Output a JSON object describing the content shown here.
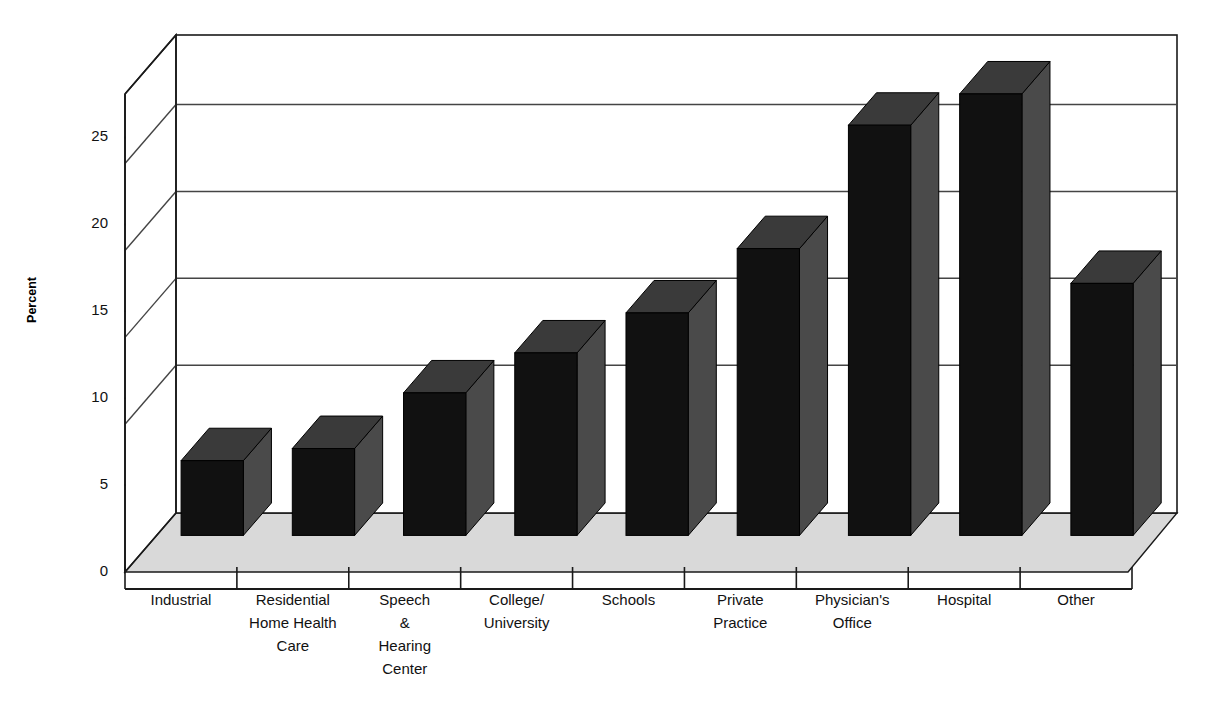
{
  "chart_data": {
    "type": "bar",
    "title": "",
    "subtitle": "",
    "xlabel": "",
    "ylabel": "Percent",
    "categories": [
      "Industrial",
      "Residential Home Health Care",
      "Speech & Hearing Center",
      "College/ University",
      "Schools",
      "Private Practice",
      "Physician's Office",
      "Hospital",
      "Other"
    ],
    "category_lines": [
      [
        "Industrial"
      ],
      [
        "Residential",
        "Home Health",
        "Care"
      ],
      [
        "Speech",
        "&",
        "Hearing",
        "Center"
      ],
      [
        "College/",
        "University"
      ],
      [
        "Schools"
      ],
      [
        "Private",
        "Practice"
      ],
      [
        "Physician's",
        "Office"
      ],
      [
        "Hospital"
      ],
      [
        "Other"
      ]
    ],
    "values": [
      4.3,
      5.0,
      8.2,
      10.5,
      12.8,
      16.5,
      23.6,
      25.4,
      14.5
    ],
    "ylim": [
      0,
      27.5
    ],
    "yticks": [
      0,
      5,
      10,
      15,
      20,
      25
    ],
    "ytick_labels": [
      "0",
      "5",
      "10",
      "15",
      "20",
      "25"
    ],
    "gridlines": [
      8.5,
      13.5,
      18.5,
      23.5
    ],
    "grid": true,
    "legend": "none",
    "three_d": true,
    "style": {
      "bar_face_color": "#111111",
      "bar_top_color": "#3a3a3a",
      "bar_side_color": "#4a4a4a",
      "floor_color": "#d9d9d9",
      "wall_color": "#ffffff",
      "axis_color": "#1a1a1a",
      "grid_color": "#444444",
      "background": "#ffffff"
    }
  }
}
